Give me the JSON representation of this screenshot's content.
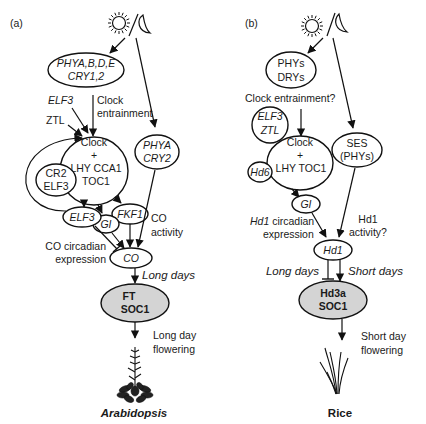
{
  "panel_a": {
    "label": "(a)",
    "nodes": {
      "photoreceptors": [
        "PHYA,B,D,E",
        "CRY1,2"
      ],
      "clock": [
        "Clock",
        "+",
        "LHY CCA1",
        "TOC1"
      ],
      "phya_cry2": [
        "PHYA",
        "CRY2"
      ],
      "cr2_elf3": [
        "CR2",
        "ELF3"
      ],
      "elf3": "ELF3",
      "gi": "GI",
      "fkf1": "FKF1",
      "co": "CO",
      "ft_soc1": [
        "FT",
        "SOC1"
      ]
    },
    "labels": {
      "elf3_input": "ELF3",
      "ztl_input": "ZTL",
      "clock_entrainment": [
        "Clock",
        "entrainment"
      ],
      "co_activity": [
        "CO",
        "activity"
      ],
      "co_circadian": [
        "CO circadian",
        "expression"
      ],
      "long_days": "Long days",
      "outcome": [
        "Long day",
        "flowering"
      ],
      "species": "Arabidopsis"
    }
  },
  "panel_b": {
    "label": "(b)",
    "nodes": {
      "photoreceptors": [
        "PHYs",
        "DRYs"
      ],
      "elf3_ztl": [
        "ELF3",
        "ZTL"
      ],
      "clock": [
        "Clock",
        "+",
        "LHY TOC1"
      ],
      "ses": [
        "SES",
        "(PHYs)"
      ],
      "hd6": "Hd6",
      "gi": "GI",
      "hd1": "Hd1",
      "hd3a_soc1": [
        "Hd3a",
        "SOC1"
      ]
    },
    "labels": {
      "clock_entrainment": "Clock entrainment?",
      "hd1_circadian": [
        "Hd1",
        " circadian",
        "expression"
      ],
      "hd1_activity": [
        "Hd1",
        "activity?"
      ],
      "long_days": "Long days",
      "short_days": "Short days",
      "outcome": [
        "Short day",
        "flowering"
      ],
      "species": "Rice"
    }
  },
  "icons": {
    "sun": "sun-icon",
    "moon": "moon-icon",
    "arabidopsis_plant": "arabidopsis-plant-icon",
    "rice_plant": "rice-plant-icon"
  }
}
